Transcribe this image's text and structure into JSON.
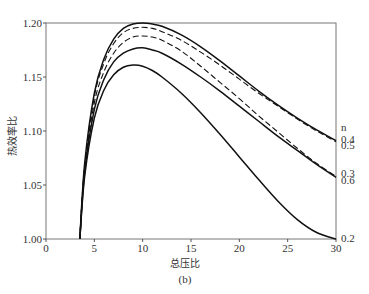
{
  "chart_data": {
    "type": "line",
    "title": "",
    "subtitle": "(b)",
    "xlabel": "总压比",
    "ylabel": "热效率比",
    "xlim": [
      0,
      30
    ],
    "ylim": [
      1.0,
      1.2
    ],
    "xticks": [
      0,
      5,
      10,
      15,
      20,
      25,
      30
    ],
    "yticks": [
      1.0,
      1.05,
      1.1,
      1.15,
      1.2
    ],
    "ytick_labels": [
      "1.00",
      "1.05",
      "1.10",
      "1.15",
      "1.20"
    ],
    "grid": false,
    "legend_title": "n",
    "legend_position": "right, at line ends",
    "series": [
      {
        "name": "n=0.4",
        "style": "solid",
        "x": [
          3.5,
          4,
          5,
          6,
          7,
          8,
          9,
          10,
          11,
          12,
          14,
          16,
          18,
          20,
          22,
          24,
          26,
          28,
          30
        ],
        "values": [
          1.0,
          1.07,
          1.135,
          1.167,
          1.185,
          1.195,
          1.199,
          1.2,
          1.199,
          1.197,
          1.189,
          1.178,
          1.165,
          1.151,
          1.137,
          1.124,
          1.112,
          1.101,
          1.091
        ]
      },
      {
        "name": "n=0.5",
        "style": "dashed",
        "x": [
          3.5,
          4,
          5,
          6,
          7,
          8,
          9,
          10,
          11,
          12,
          14,
          16,
          18,
          20,
          22,
          24,
          26,
          28,
          30
        ],
        "values": [
          1.0,
          1.068,
          1.132,
          1.163,
          1.181,
          1.191,
          1.195,
          1.196,
          1.195,
          1.192,
          1.184,
          1.173,
          1.161,
          1.148,
          1.135,
          1.123,
          1.111,
          1.1,
          1.09
        ]
      },
      {
        "name": "n=0.3",
        "style": "dashed",
        "x": [
          3.5,
          4,
          5,
          6,
          7,
          8,
          9,
          10,
          11,
          12,
          14,
          16,
          18,
          20,
          22,
          24,
          26,
          28,
          30
        ],
        "values": [
          1.0,
          1.065,
          1.126,
          1.155,
          1.172,
          1.182,
          1.187,
          1.188,
          1.187,
          1.184,
          1.174,
          1.16,
          1.145,
          1.13,
          1.114,
          1.099,
          1.084,
          1.07,
          1.058
        ]
      },
      {
        "name": "n=0.6",
        "style": "solid",
        "x": [
          3.5,
          4,
          5,
          6,
          7,
          8,
          9,
          10,
          11,
          12,
          14,
          16,
          18,
          20,
          22,
          24,
          26,
          28,
          30
        ],
        "values": [
          1.0,
          1.062,
          1.12,
          1.148,
          1.164,
          1.172,
          1.176,
          1.177,
          1.175,
          1.172,
          1.162,
          1.15,
          1.137,
          1.123,
          1.109,
          1.095,
          1.082,
          1.069,
          1.057
        ]
      },
      {
        "name": "n=0.2",
        "style": "solid",
        "x": [
          3.5,
          4,
          5,
          6,
          7,
          8,
          9,
          10,
          11,
          12,
          14,
          16,
          18,
          20,
          22,
          24,
          26,
          28,
          30
        ],
        "values": [
          1.0,
          1.058,
          1.112,
          1.138,
          1.152,
          1.159,
          1.161,
          1.16,
          1.156,
          1.15,
          1.135,
          1.117,
          1.097,
          1.076,
          1.055,
          1.035,
          1.018,
          1.006,
          1.0
        ]
      }
    ],
    "end_labels": [
      {
        "text": "n",
        "value": 1.104
      },
      {
        "text": "0.4",
        "value": 1.093
      },
      {
        "text": "0.5",
        "value": 1.087
      },
      {
        "text": "0.3",
        "value": 1.061
      },
      {
        "text": "0.6",
        "value": 1.055
      },
      {
        "text": "0.2",
        "value": 1.001
      }
    ]
  }
}
